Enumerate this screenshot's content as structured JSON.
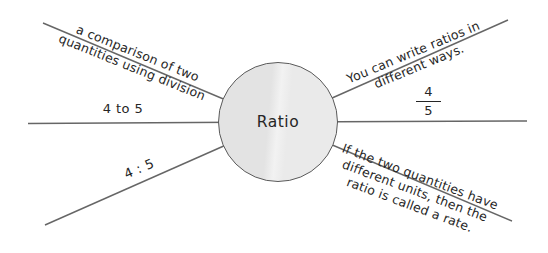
{
  "diagram": {
    "center_label": "Ratio",
    "labels": {
      "definition": {
        "line1": "a comparison of two",
        "line2": "quantities using division"
      },
      "word_form": "4 to 5",
      "colon_form": "4 : 5",
      "ways": {
        "line1": "You can write ratios in",
        "line2": "different ways."
      },
      "fraction": {
        "numerator": "4",
        "denominator": "5"
      },
      "rate": {
        "line1": "If the two quantities have",
        "line2": "different units, then the",
        "line3": "ratio is called a rate."
      }
    },
    "colors": {
      "background": "#ffffff",
      "line": "#666666",
      "text": "#262626",
      "circle_stroke": "#5a5a5a",
      "circle_fill_left": "#e3e3e3",
      "circle_fill_right": "#eaeaea",
      "circle_seam": "#f2f2f2"
    }
  }
}
